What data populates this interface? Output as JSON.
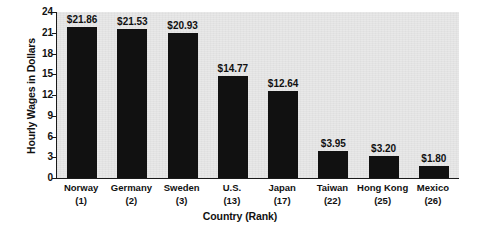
{
  "chart_data": {
    "type": "bar",
    "title": "",
    "xlabel": "Country (Rank)",
    "ylabel": "Hourly Wages in Dollars",
    "categories": [
      "Norway",
      "Germany",
      "Sweden",
      "U.S.",
      "Japan",
      "Taiwan",
      "Hong Kong",
      "Mexico"
    ],
    "ranks": [
      "(1)",
      "(2)",
      "(3)",
      "(13)",
      "(17)",
      "(22)",
      "(25)",
      "(26)"
    ],
    "values": [
      21.86,
      21.53,
      20.93,
      14.77,
      12.64,
      3.95,
      3.2,
      1.8
    ],
    "value_labels": [
      "$21.86",
      "$21.53",
      "$20.93",
      "$14.77",
      "$12.64",
      "$3.95",
      "$3.20",
      "$1.80"
    ],
    "ylim": [
      0,
      24
    ],
    "yticks": [
      0,
      3,
      6,
      9,
      12,
      15,
      18,
      21,
      24
    ],
    "ytick_labels": [
      "0",
      "3",
      "6",
      "9",
      "12",
      "15",
      "18",
      "21",
      "24"
    ],
    "grid": false,
    "legend": "none",
    "bar_color": "#111111",
    "plot_background": "#e8e8e8",
    "axis_color": "#1a1a1a"
  }
}
